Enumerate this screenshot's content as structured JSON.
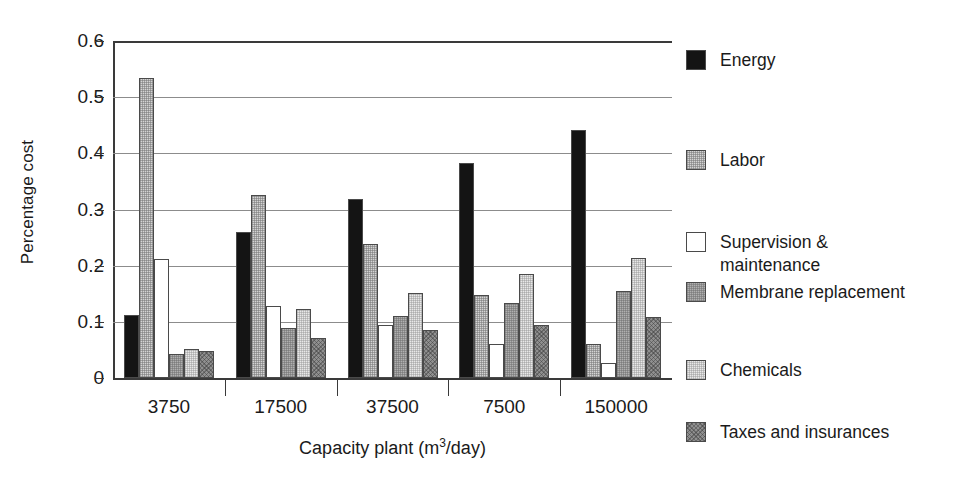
{
  "chart_data": {
    "type": "bar",
    "title": "",
    "xlabel": "Capacity plant (m3/day)",
    "xlabel_base": "Capacity plant (m",
    "xlabel_sup": "3",
    "xlabel_tail": "/day)",
    "ylabel": "Percentage cost",
    "categories": [
      "3750",
      "17500",
      "37500",
      "7500",
      "150000"
    ],
    "ylim": [
      0,
      0.6
    ],
    "yticks": [
      "0",
      "0.1",
      "0.2",
      "0.3",
      "0.4",
      "0.5",
      "0.6"
    ],
    "ytick_values": [
      0,
      0.1,
      0.2,
      0.3,
      0.4,
      0.5,
      0.6
    ],
    "grid": true,
    "legend_position": "right",
    "series": [
      {
        "name": "Energy",
        "color": "#141414",
        "swatch_class": "sw-energy",
        "values": [
          0.113,
          0.26,
          0.319,
          0.382,
          0.442
        ]
      },
      {
        "name": "Labor",
        "color": "#d4d4d4",
        "swatch_class": "sw-labor",
        "values": [
          0.534,
          0.325,
          0.238,
          0.148,
          0.06
        ]
      },
      {
        "name": "Supervision & maintenance",
        "color": "#ffffff",
        "swatch_class": "sw-supervision",
        "values": [
          0.212,
          0.129,
          0.095,
          0.06,
          0.027
        ]
      },
      {
        "name": "Membrane replacement",
        "color": "#b0b0b0",
        "swatch_class": "sw-membrane",
        "values": [
          0.042,
          0.089,
          0.111,
          0.133,
          0.155
        ]
      },
      {
        "name": "Chemicals",
        "color": "#e8e8e8",
        "swatch_class": "sw-chemicals",
        "values": [
          0.051,
          0.122,
          0.152,
          0.185,
          0.213
        ]
      },
      {
        "name": "Taxes and insurances",
        "color": "#8f8f8f",
        "swatch_class": "sw-taxes",
        "values": [
          0.048,
          0.072,
          0.085,
          0.095,
          0.108
        ]
      }
    ]
  },
  "legend": {
    "items": [
      {
        "label": "Energy",
        "swatch_class": "sw-energy"
      },
      {
        "label": "Labor",
        "swatch_class": "sw-labor"
      },
      {
        "label": "Supervision &\nmaintenance",
        "swatch_class": "sw-supervision"
      },
      {
        "label": "Membrane replacement",
        "swatch_class": "sw-membrane"
      },
      {
        "label": "Chemicals",
        "swatch_class": "sw-chemicals"
      },
      {
        "label": "Taxes and insurances",
        "swatch_class": "sw-taxes"
      }
    ],
    "item_tops": [
      8,
      108,
      190,
      240,
      318,
      380
    ]
  }
}
